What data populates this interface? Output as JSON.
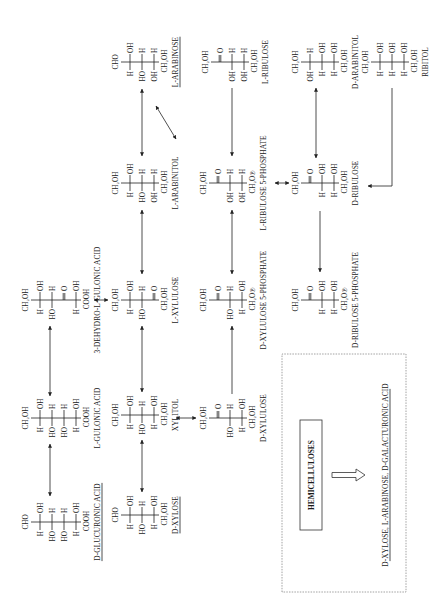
{
  "figure": {
    "orientation": "rotated -90deg (landscape figure printed on portrait page)",
    "reading_frame": {
      "width": 616,
      "height": 438
    }
  },
  "compounds": [
    {
      "id": "d-glucuronic-acid",
      "name": "D-GLUCURONIC ACID",
      "underline": true,
      "x": 94,
      "y": 22,
      "top": "CHO",
      "rows": [
        [
          "H",
          "OH"
        ],
        [
          "HO",
          "H"
        ],
        [
          "HO",
          "H"
        ],
        [
          "H",
          "OH"
        ]
      ],
      "bottom": "COOH"
    },
    {
      "id": "d-xylose",
      "name": "D-XYLOSE",
      "underline": true,
      "x": 101,
      "y": 112,
      "top": "CHO",
      "rows": [
        [
          "H",
          "OH"
        ],
        [
          "HO",
          "H"
        ],
        [
          "H",
          "OH"
        ]
      ],
      "bottom": "CH₂OH"
    },
    {
      "id": "l-gulonic-acid",
      "name": "L-GULONIC ACID",
      "underline": false,
      "x": 198,
      "y": 22,
      "top": "CH₂OH",
      "rows": [
        [
          "H",
          "OH"
        ],
        [
          "HO",
          "H"
        ],
        [
          "HO",
          "H"
        ],
        [
          "H",
          "OH"
        ]
      ],
      "bottom": "COOH"
    },
    {
      "id": "xylitol",
      "name": "XYLITOL",
      "underline": false,
      "x": 201,
      "y": 112,
      "top": "CH₂OH",
      "rows": [
        [
          "H",
          "OH"
        ],
        [
          "HO",
          "H"
        ],
        [
          "H",
          "OH"
        ]
      ],
      "bottom": "CH₂OH"
    },
    {
      "id": "d-xylulose",
      "name": "D-XYLULOSE",
      "underline": false,
      "x": 198,
      "y": 200,
      "top": "CH₂OH",
      "rows": [
        [
          "",
          "=O"
        ],
        [
          "HO",
          "H"
        ],
        [
          "H",
          "OH"
        ]
      ],
      "bottom": "CH₂OH"
    },
    {
      "id": "3-dehydro-l-gulonic-acid",
      "name": "3-DEHYDRO-L-GULONIC ACID",
      "underline": false,
      "x": 316,
      "y": 22,
      "top": "CH₂OH",
      "rows": [
        [
          "H",
          "OH"
        ],
        [
          "HO",
          "H"
        ],
        [
          "",
          "=O"
        ],
        [
          "H",
          "OH"
        ]
      ],
      "bottom": "COOH"
    },
    {
      "id": "l-xylulose",
      "name": "L-XYLULOSE",
      "underline": false,
      "x": 316,
      "y": 112,
      "top": "CH₂OH",
      "rows": [
        [
          "H",
          "OH"
        ],
        [
          "HO",
          "H"
        ],
        [
          "",
          "=O"
        ]
      ],
      "bottom": "CH₂OH"
    },
    {
      "id": "d-xylulose-5-phosphate",
      "name": "D-XYLULOSE 5-PHOSPHATE",
      "underline": false,
      "x": 316,
      "y": 200,
      "top": "CH₂OH",
      "rows": [
        [
          "",
          "=O"
        ],
        [
          "HO",
          "H"
        ],
        [
          "H",
          "OH"
        ]
      ],
      "bottom": "CH₂O℗"
    },
    {
      "id": "d-ribulose-5-phosphate",
      "name": "D-RIBULOSE 5-PHOSPHATE",
      "underline": false,
      "x": 316,
      "y": 292,
      "top": "CH₂OH",
      "rows": [
        [
          "",
          "=O"
        ],
        [
          "H",
          "OH"
        ],
        [
          "H",
          "OH"
        ]
      ],
      "bottom": "CH₂O℗"
    },
    {
      "id": "l-arabinitol",
      "name": "L-ARABINITOL",
      "underline": false,
      "x": 433,
      "y": 112,
      "top": "CH₂OH",
      "rows": [
        [
          "H",
          "OH"
        ],
        [
          "HO",
          "H"
        ],
        [
          "OH",
          "H"
        ]
      ],
      "bottom": "CH₂OH"
    },
    {
      "id": "l-ribulose-5-phosphate",
      "name": "L-RIBULOSE 5-PHOSPHATE",
      "underline": false,
      "x": 433,
      "y": 200,
      "top": "CH₂OH",
      "rows": [
        [
          "",
          "=O"
        ],
        [
          "OH",
          "H"
        ],
        [
          "OH",
          "H"
        ]
      ],
      "bottom": "CH₂O℗"
    },
    {
      "id": "d-ribulose",
      "name": "D-RIBULOSE",
      "underline": false,
      "x": 433,
      "y": 292,
      "top": "CH₂OH",
      "rows": [
        [
          "",
          "=O"
        ],
        [
          "H",
          "OH"
        ],
        [
          "H",
          "OH"
        ]
      ],
      "bottom": "CH₂OH"
    },
    {
      "id": "l-arabinose",
      "name": "L-ARABINOSE",
      "underline": true,
      "x": 554,
      "y": 112,
      "top": "CHO",
      "rows": [
        [
          "H",
          "OH"
        ],
        [
          "HO",
          "H"
        ],
        [
          "OH",
          "H"
        ]
      ],
      "bottom": "CH₂OH"
    },
    {
      "id": "l-ribulose",
      "name": "L-RIBULOSE",
      "underline": false,
      "x": 554,
      "y": 202,
      "top": "CH₂OH",
      "rows": [
        [
          "",
          "=O"
        ],
        [
          "OH",
          "H"
        ],
        [
          "OH",
          "H"
        ]
      ],
      "bottom": "CH₂OH"
    },
    {
      "id": "d-arabinitol",
      "name": "D-ARABINITOL",
      "underline": false,
      "x": 554,
      "y": 292,
      "top": "CH₂OH",
      "rows": [
        [
          "OH",
          "H"
        ],
        [
          "H",
          "OH"
        ],
        [
          "H",
          "OH"
        ]
      ],
      "bottom": "CH₂OH"
    },
    {
      "id": "ribitol",
      "name": "RIBITOL",
      "underline": false,
      "x": 554,
      "y": 362,
      "top": "CH₂OH",
      "rows": [
        [
          "H",
          "OH"
        ],
        [
          "H",
          "OH"
        ],
        [
          "H",
          "OH"
        ]
      ],
      "bottom": "CH₂OH"
    }
  ],
  "arrows": [
    {
      "from": "d-glucuronic-acid",
      "to": "l-gulonic-acid",
      "pts": [
        [
          120,
          50
        ],
        [
          172,
          50
        ]
      ],
      "heads": "both"
    },
    {
      "from": "d-xylose",
      "to": "xylitol",
      "pts": [
        [
          124,
          142
        ],
        [
          176,
          142
        ]
      ],
      "heads": "both"
    },
    {
      "from": "l-gulonic-acid",
      "to": "3-dehydro-l-gulonic-acid",
      "pts": [
        [
          220,
          50
        ],
        [
          290,
          50
        ]
      ],
      "heads": "both"
    },
    {
      "from": "xylitol",
      "to": "l-xylulose",
      "pts": [
        [
          224,
          142
        ],
        [
          290,
          142
        ]
      ],
      "heads": "both"
    },
    {
      "from": "xylitol",
      "to": "d-xylulose",
      "pts": [
        [
          198,
          176
        ],
        [
          198,
          196
        ]
      ],
      "heads": "both"
    },
    {
      "from": "3-dehydro-l-gulonic-acid",
      "to": "l-xylulose",
      "pts": [
        [
          316,
          94
        ],
        [
          316,
          108
        ]
      ],
      "heads": "both"
    },
    {
      "from": "d-xylulose",
      "to": "d-xylulose-5-phosphate",
      "pts": [
        [
          222,
          232
        ],
        [
          290,
          232
        ]
      ],
      "heads": "end"
    },
    {
      "from": "l-xylulose",
      "to": "l-arabinitol",
      "pts": [
        [
          342,
          142
        ],
        [
          406,
          142
        ]
      ],
      "heads": "both"
    },
    {
      "from": "d-xylulose-5-phosphate",
      "to": "l-ribulose-5-phosphate",
      "pts": [
        [
          342,
          232
        ],
        [
          406,
          232
        ]
      ],
      "heads": "both"
    },
    {
      "from": "l-ribulose-5-phosphate",
      "to": "d-ribulose",
      "pts": [
        [
          433,
          275
        ],
        [
          433,
          289
        ]
      ],
      "heads": "both"
    },
    {
      "from": "d-ribulose",
      "to": "d-ribulose-5-phosphate",
      "pts": [
        [
          405,
          320
        ],
        [
          344,
          320
        ]
      ],
      "heads": "end"
    },
    {
      "from": "l-arabinose",
      "to": "l-arabinitol",
      "pts": [
        [
          527,
          142
        ],
        [
          460,
          142
        ]
      ],
      "heads": "both"
    },
    {
      "from": "l-arabinose",
      "to": "l-ribulose",
      "pts": [
        [
          510,
          156
        ],
        [
          477,
          176
        ]
      ],
      "heads": "both"
    },
    {
      "from": "l-ribulose",
      "to": "l-ribulose-5-phosphate",
      "pts": [
        [
          528,
          232
        ],
        [
          460,
          232
        ]
      ],
      "heads": "end"
    },
    {
      "from": "d-arabinitol",
      "to": "d-ribulose",
      "pts": [
        [
          528,
          316
        ],
        [
          458,
          316
        ]
      ],
      "heads": "both"
    },
    {
      "from": "ribitol",
      "to": "d-ribulose",
      "pts": [
        [
          528,
          392
        ],
        [
          430,
          392
        ],
        [
          430,
          368
        ]
      ],
      "heads": "end"
    }
  ],
  "box": {
    "frame": {
      "x": 24,
      "y": 282,
      "w": 238,
      "h": 124
    },
    "source_label": "HEMICELLULOSES",
    "source_box": {
      "x": 86,
      "y": 300,
      "w": 110,
      "h": 22
    },
    "products_label": "D-XYLOSE, L-ARABINOSE, D-GALACTURONIC ACID",
    "products_pos": {
      "x": 141,
      "y": 388
    }
  }
}
